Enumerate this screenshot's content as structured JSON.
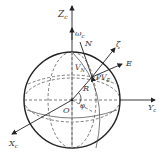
{
  "diagram": {
    "labels": {
      "z_axis": "Z",
      "z_sub": "c",
      "omega": "ω",
      "omega_sub": "c",
      "north": "N",
      "zeta": "ζ",
      "east": "E",
      "vn": "V",
      "vn_sub": "N",
      "pve": "PV",
      "pve_sub": "E",
      "radius": "R",
      "origin": "O",
      "latitude": "φ",
      "y_axis": "Y",
      "y_sub": "c",
      "x_axis": "X",
      "x_sub": "c"
    },
    "colors": {
      "stroke": "#222222",
      "dashed": "#444444"
    }
  }
}
